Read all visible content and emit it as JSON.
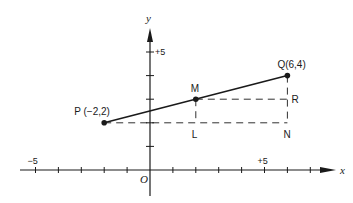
{
  "figure": {
    "x_axis_label": "x",
    "y_axis_label": "y",
    "origin_label": "O",
    "x_range": [
      -6,
      7
    ],
    "y_range": [
      -1,
      6
    ],
    "x_tick_labels": [
      {
        "value": -5,
        "text": "−5"
      },
      {
        "value": 5,
        "text": "+5"
      }
    ],
    "y_tick_labels": [
      {
        "value": 5,
        "text": "+5"
      }
    ],
    "colors": {
      "ink": "#1a1a1a",
      "background": "#ffffff"
    }
  },
  "points": [
    {
      "id": "P",
      "label": "P (−2,2)",
      "x": -2,
      "y": 2,
      "dot": true
    },
    {
      "id": "Q",
      "label": "Q(6,4)",
      "x": 6,
      "y": 4,
      "dot": true
    },
    {
      "id": "M",
      "label": "M",
      "x": 2,
      "y": 3,
      "dot": true
    },
    {
      "id": "L",
      "label": "L",
      "x": 2,
      "y": 2,
      "dot": false
    },
    {
      "id": "N",
      "label": "N",
      "x": 6,
      "y": 2,
      "dot": false
    },
    {
      "id": "R",
      "label": "R",
      "x": 6,
      "y": 3,
      "dot": false
    }
  ],
  "segments": [
    {
      "from": "P",
      "to": "Q",
      "style": "solid"
    },
    {
      "from": "P",
      "to": "N",
      "style": "dashed"
    },
    {
      "from": "M",
      "to": "R",
      "style": "dashed"
    },
    {
      "from": "M",
      "to": "L",
      "style": "dashed"
    },
    {
      "from": "Q",
      "to": "N",
      "style": "dashed"
    }
  ]
}
